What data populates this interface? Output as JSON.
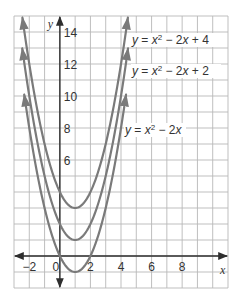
{
  "chart_data": {
    "type": "line",
    "title": "",
    "xlabel": "x",
    "ylabel": "y",
    "xlim": [
      -3,
      11
    ],
    "ylim": [
      -2,
      15
    ],
    "grid": true,
    "grid_step": 1,
    "x_ticks": [
      -2,
      0,
      2,
      4,
      6,
      8
    ],
    "x_tick_labels": [
      "−2",
      "0",
      "2",
      "4",
      "6",
      "8"
    ],
    "y_ticks": [
      6,
      8,
      10,
      12,
      14
    ],
    "y_tick_labels": [
      "6",
      "8",
      "10",
      "12",
      "14"
    ],
    "legend": "inline labels",
    "series": [
      {
        "name": "y = x² − 2x + 4",
        "label_parts": {
          "lhs": "y",
          "eq": " = ",
          "x": "x",
          "exp": "2",
          "rest": " − 2",
          "x2": "x",
          "tail": " + 4"
        },
        "a": 1,
        "b": -2,
        "c": 4,
        "vertex": [
          1,
          3
        ],
        "x_range": [
          -2.45,
          4.45
        ],
        "points": [
          [
            -2,
            12
          ],
          [
            -1,
            7
          ],
          [
            0,
            4
          ],
          [
            1,
            3
          ],
          [
            2,
            4
          ],
          [
            3,
            7
          ],
          [
            4,
            12
          ]
        ],
        "label_pos": [
          132,
          44
        ]
      },
      {
        "name": "y = x² − 2x + 2",
        "label_parts": {
          "lhs": "y",
          "eq": " = ",
          "x": "x",
          "exp": "2",
          "rest": " − 2",
          "x2": "x",
          "tail": " + 2"
        },
        "a": 1,
        "b": -2,
        "c": 2,
        "vertex": [
          1,
          1
        ],
        "x_range": [
          -2.46,
          4.46
        ],
        "points": [
          [
            -2,
            10
          ],
          [
            -1,
            5
          ],
          [
            0,
            2
          ],
          [
            1,
            1
          ],
          [
            2,
            2
          ],
          [
            3,
            5
          ],
          [
            4,
            10
          ]
        ],
        "label_pos": [
          132,
          75
        ]
      },
      {
        "name": "y = x² − 2x",
        "label_parts": {
          "lhs": "y",
          "eq": " = ",
          "x": "x",
          "exp": "2",
          "rest": " − 2",
          "x2": "x",
          "tail": ""
        },
        "a": 1,
        "b": -2,
        "c": 0,
        "vertex": [
          1,
          -1
        ],
        "x_range": [
          -2.33,
          4.33
        ],
        "points": [
          [
            -2,
            8
          ],
          [
            -1,
            3
          ],
          [
            0,
            0
          ],
          [
            1,
            -1
          ],
          [
            2,
            0
          ],
          [
            3,
            3
          ],
          [
            4,
            8
          ]
        ],
        "label_pos": [
          125,
          134
        ]
      }
    ]
  },
  "style": {
    "curve_color": "#7a7a7a",
    "axis_color": "#2e2e2e",
    "grid_color": "#b8b8b8",
    "text_color": "#333333",
    "background": "#ffffff"
  },
  "layout": {
    "plot_px": {
      "left": 14,
      "right": 228,
      "top": 16,
      "bottom": 288
    }
  }
}
